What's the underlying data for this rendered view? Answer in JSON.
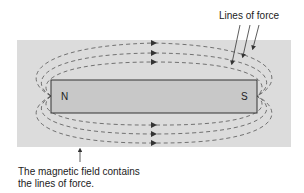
{
  "diagram": {
    "magnet": {
      "north_label": "N",
      "south_label": "S"
    },
    "labels": {
      "lines_of_force": "Lines of force",
      "caption_line1": "The magnetic field contains",
      "caption_line2": "the lines of force."
    },
    "colors": {
      "field_bg": "#dcdcdc",
      "magnet_fill": "#c8c8c8",
      "line": "#555555"
    }
  }
}
